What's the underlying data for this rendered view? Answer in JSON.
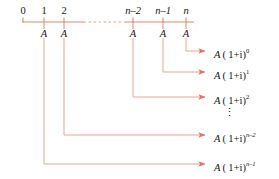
{
  "diagram": {
    "colors": {
      "timeline": "#e8806e",
      "arrow": "#e8735c",
      "text": "#151515",
      "background": "#ffffff"
    },
    "timeline": {
      "axis_y": 22,
      "x_start": 22,
      "x_end": 194,
      "dashed_from": 83,
      "dashed_to": 124,
      "tick_height": 5
    },
    "periods": [
      {
        "label": "0",
        "x": 23,
        "italic": false,
        "tick": true,
        "payment": null
      },
      {
        "label": "1",
        "x": 44,
        "italic": false,
        "tick": true,
        "payment": "A"
      },
      {
        "label": "2",
        "x": 64,
        "italic": false,
        "tick": true,
        "payment": "A"
      },
      {
        "label": "n–2",
        "x": 133,
        "italic": true,
        "tick": true,
        "payment": "A"
      },
      {
        "label": "n–1",
        "x": 163,
        "italic": true,
        "tick": true,
        "payment": "A"
      },
      {
        "label": "n",
        "x": 186,
        "italic": true,
        "tick": true,
        "payment": "A"
      }
    ],
    "payment_symbol": "A",
    "payment_label_y": 34,
    "formulas": [
      {
        "base": "A",
        "open": "(",
        "inner": "1+i",
        "close": ")",
        "exponent": "0",
        "exponent_italic": false,
        "x": 214,
        "y": 55,
        "from_x": 186,
        "elbow_y": 51
      },
      {
        "base": "A",
        "open": "(",
        "inner": "1+i",
        "close": ")",
        "exponent": "1",
        "exponent_italic": false,
        "x": 214,
        "y": 76,
        "from_x": 163,
        "elbow_y": 72
      },
      {
        "base": "A",
        "open": "(",
        "inner": "1+i",
        "close": ")",
        "exponent": "2",
        "exponent_italic": false,
        "x": 214,
        "y": 101,
        "from_x": 133,
        "elbow_y": 97
      },
      {
        "base": "A",
        "open": "(",
        "inner": "1+i",
        "close": ")",
        "exponent": "n–2",
        "exponent_italic": true,
        "x": 214,
        "y": 139,
        "from_x": 64,
        "elbow_y": 135
      },
      {
        "base": "A",
        "open": "(",
        "inner": "1+i",
        "close": ")",
        "exponent": "n–1",
        "exponent_italic": true,
        "x": 214,
        "y": 168,
        "from_x": 44,
        "elbow_y": 164
      }
    ],
    "ellipsis": {
      "glyph": "⋮",
      "x": 229,
      "y": 113
    },
    "arrow_head_tip_x": 211
  }
}
